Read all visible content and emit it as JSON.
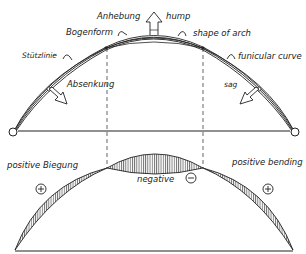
{
  "diagram": {
    "upper": {
      "labels": {
        "anhebung": "Anhebung",
        "hump": "hump",
        "bogenform": "Bogenform",
        "shape_of_arch": "shape of arch",
        "stuetzlinie": "Stützlinie",
        "funicular_curve": "funicular curve",
        "absenkung": "Absenkung",
        "sag": "sag"
      }
    },
    "lower": {
      "labels": {
        "positive_biegung": "positive Biegung",
        "positive_bending": "positive bending",
        "negative": "negative",
        "plus_symbol": "+",
        "minus_symbol": "−"
      }
    },
    "colors": {
      "line": "#222222",
      "background": "#ffffff"
    }
  }
}
